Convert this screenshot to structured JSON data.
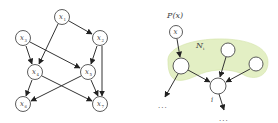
{
  "left_diagram": {
    "title": "Bayesian network over x1..x7",
    "nodes": [
      {
        "id": "x1",
        "label": "x",
        "sub": "1",
        "cx": 62,
        "cy": 17
      },
      {
        "id": "x2",
        "label": "x",
        "sub": "2",
        "cx": 100,
        "cy": 38
      },
      {
        "id": "x3",
        "label": "x",
        "sub": "3",
        "cx": 23,
        "cy": 38
      },
      {
        "id": "x4",
        "label": "x",
        "sub": "4",
        "cx": 35,
        "cy": 72
      },
      {
        "id": "x5",
        "label": "x",
        "sub": "5",
        "cx": 88,
        "cy": 72
      },
      {
        "id": "x6",
        "label": "x",
        "sub": "6",
        "cx": 23,
        "cy": 104
      },
      {
        "id": "x7",
        "label": "x",
        "sub": "7",
        "cx": 100,
        "cy": 104
      }
    ],
    "edges": [
      [
        "x1",
        "x2"
      ],
      [
        "x1",
        "x4"
      ],
      [
        "x3",
        "x4"
      ],
      [
        "x3",
        "x5"
      ],
      [
        "x2",
        "x5"
      ],
      [
        "x2",
        "x7"
      ],
      [
        "x4",
        "x6"
      ],
      [
        "x4",
        "x7"
      ],
      [
        "x5",
        "x6"
      ],
      [
        "x5",
        "x7"
      ]
    ]
  },
  "right_diagram": {
    "prior_label": "P(x)",
    "x_node_label": "x",
    "neighborhood_label": "N",
    "neighborhood_sub": "i",
    "target_node_label": "i",
    "ellipsis_left": "...",
    "ellipsis_bottom": "...",
    "blob_color": "#e3efc4",
    "blob_stroke": "#d2e3a6"
  }
}
